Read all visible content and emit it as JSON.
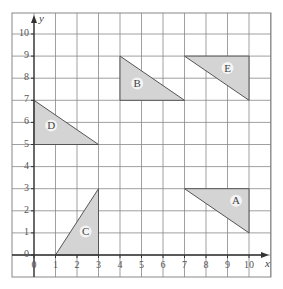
{
  "diagram": {
    "type": "coordinate-grid",
    "x_axis": {
      "label": "x",
      "min": 0,
      "max": 10,
      "ticks": [
        "0",
        "1",
        "2",
        "3",
        "4",
        "5",
        "6",
        "7",
        "8",
        "9",
        "10"
      ]
    },
    "y_axis": {
      "label": "y",
      "min": 0,
      "max": 10,
      "ticks": [
        "0",
        "1",
        "2",
        "3",
        "4",
        "5",
        "6",
        "7",
        "8",
        "9",
        "10"
      ]
    },
    "colors": {
      "grid": "#888888",
      "shape_fill": "#d4d4d4",
      "shape_stroke": "#555555",
      "axis": "#333333"
    },
    "shapes": [
      {
        "label": "A",
        "vertices": [
          [
            7,
            3
          ],
          [
            10,
            3
          ],
          [
            10,
            1
          ]
        ],
        "label_pos": [
          9.4,
          2.3
        ]
      },
      {
        "label": "B",
        "vertices": [
          [
            4,
            9
          ],
          [
            4,
            7
          ],
          [
            7,
            7
          ]
        ],
        "label_pos": [
          4.8,
          7.6
        ]
      },
      {
        "label": "C",
        "vertices": [
          [
            1,
            0
          ],
          [
            3,
            0
          ],
          [
            3,
            3
          ]
        ],
        "label_pos": [
          2.4,
          0.9
        ]
      },
      {
        "label": "D",
        "vertices": [
          [
            0,
            7
          ],
          [
            0,
            5
          ],
          [
            3,
            5
          ]
        ],
        "label_pos": [
          0.8,
          5.7
        ]
      },
      {
        "label": "E",
        "vertices": [
          [
            7,
            9
          ],
          [
            10,
            9
          ],
          [
            10,
            7
          ]
        ],
        "label_pos": [
          9.0,
          8.3
        ]
      }
    ]
  }
}
